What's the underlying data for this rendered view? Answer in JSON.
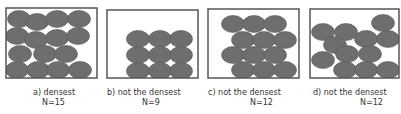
{
  "figure": {
    "ellipse_color": "#6e6e6e",
    "border_color": "#555555",
    "panels": [
      {
        "id": "a",
        "label": "a) densest",
        "count_label": "N=15",
        "n": 15,
        "box": {
          "x": 6,
          "y": 8,
          "w": 91,
          "h": 70
        },
        "ellipses": [
          [
            19,
            19
          ],
          [
            37,
            22
          ],
          [
            57,
            19
          ],
          [
            79,
            19
          ],
          [
            17,
            36
          ],
          [
            36,
            40
          ],
          [
            57,
            38
          ],
          [
            78,
            36
          ],
          [
            20,
            54
          ],
          [
            45,
            54
          ],
          [
            66,
            54
          ],
          [
            17,
            70
          ],
          [
            38,
            70
          ],
          [
            58,
            70
          ],
          [
            80,
            70
          ]
        ]
      },
      {
        "id": "b",
        "label": "b) not the densest",
        "count_label": "N=9",
        "n": 9,
        "box": {
          "x": 107,
          "y": 10,
          "w": 91,
          "h": 68
        },
        "ellipses": [
          [
            138,
            39
          ],
          [
            160,
            39
          ],
          [
            181,
            39
          ],
          [
            138,
            55
          ],
          [
            160,
            55
          ],
          [
            181,
            55
          ],
          [
            138,
            71
          ],
          [
            160,
            71
          ],
          [
            181,
            71
          ]
        ]
      },
      {
        "id": "c",
        "label": "c) not the densest",
        "count_label": "N=12",
        "n": 12,
        "box": {
          "x": 208,
          "y": 9,
          "w": 91,
          "h": 69
        },
        "ellipses": [
          [
            233,
            24
          ],
          [
            254,
            24
          ],
          [
            275,
            24
          ],
          [
            243,
            40
          ],
          [
            264,
            40
          ],
          [
            285,
            40
          ],
          [
            233,
            55
          ],
          [
            254,
            55
          ],
          [
            275,
            55
          ],
          [
            243,
            70
          ],
          [
            264,
            70
          ],
          [
            285,
            70
          ]
        ]
      },
      {
        "id": "d",
        "label": "d) not the densest",
        "count_label": "N=12",
        "n": 12,
        "box": {
          "x": 310,
          "y": 9,
          "w": 89,
          "h": 69
        },
        "ellipses": [
          [
            323,
            32
          ],
          [
            346,
            32
          ],
          [
            383,
            23
          ],
          [
            335,
            45
          ],
          [
            366,
            39
          ],
          [
            388,
            39
          ],
          [
            347,
            54
          ],
          [
            370,
            54
          ],
          [
            323,
            60
          ],
          [
            345,
            70
          ],
          [
            366,
            70
          ],
          [
            388,
            70
          ]
        ]
      }
    ]
  }
}
